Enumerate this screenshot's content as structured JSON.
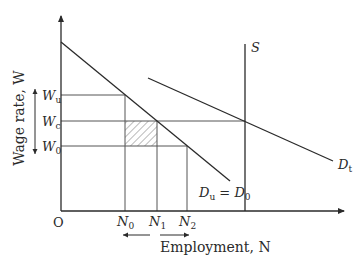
{
  "diagram": {
    "type": "labour-market",
    "colors": {
      "line": "#2a2a2a",
      "grid": "#555555",
      "hatch": "#777777",
      "background": "#ffffff"
    },
    "y_axis": {
      "label": "Wage rate, W",
      "origin_label": "O"
    },
    "x_axis": {
      "label": "Employment, N"
    },
    "wage_levels": [
      {
        "id": "Wu",
        "base": "W",
        "sub": "u"
      },
      {
        "id": "Wc",
        "base": "W",
        "sub": "c"
      },
      {
        "id": "W0",
        "base": "W",
        "sub": "0"
      }
    ],
    "employment_levels": [
      {
        "id": "N0",
        "base": "N",
        "sub": "0"
      },
      {
        "id": "N1",
        "base": "N",
        "sub": "1"
      },
      {
        "id": "N2",
        "base": "N",
        "sub": "2"
      }
    ],
    "curves": {
      "supply": {
        "label": "S"
      },
      "demand_total": {
        "base": "D",
        "sub": "t"
      },
      "demand_union": {
        "base1": "D",
        "sub1": "u",
        "eq": " = ",
        "base2": "D",
        "sub2": "0"
      }
    },
    "annotations": {
      "hatched_area": "rectangle between N0–N1 and W0–Wc",
      "wage_double_arrow": "vertical double-headed arrow beside wage levels",
      "employment_arrows": "left arrow and right arrow below N labels"
    }
  }
}
